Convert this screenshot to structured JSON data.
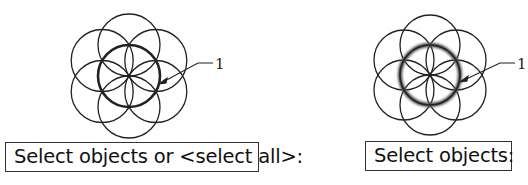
{
  "figures": [
    {
      "id": "left",
      "center": [
        129,
        76
      ],
      "radius": 31,
      "highlight": "bold",
      "callout_label": "1",
      "prompt_text": "Select objects or <select all>:"
    },
    {
      "id": "right",
      "center": [
        430,
        75
      ],
      "radius": 30,
      "highlight": "blurred-selection",
      "callout_label": "1",
      "prompt_text": "Select objects:"
    }
  ],
  "colors": {
    "stroke": "#222222",
    "background": "#ffffff",
    "box_border": "#333333"
  }
}
